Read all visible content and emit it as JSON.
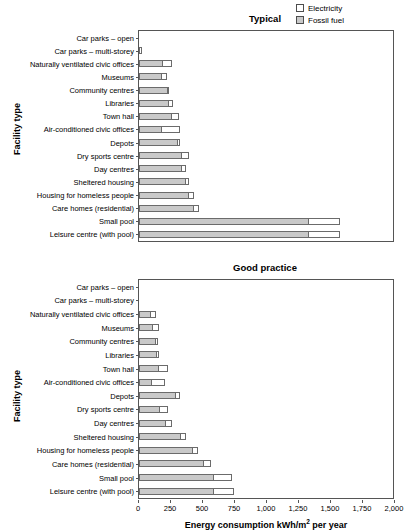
{
  "legend": {
    "items": [
      {
        "label": "Electricity",
        "key": "electricity",
        "color": "#ffffff"
      },
      {
        "label": "Fossil fuel",
        "key": "fossil",
        "color": "#c9c9c9"
      }
    ]
  },
  "axis": {
    "x_title_main": "Energy consumption kWh/m",
    "x_title_sup": "2",
    "x_title_tail": " per year",
    "x_title_full": "Energy consumption kWh/m2 per year",
    "y_title": "Facility type",
    "x_ticks": [
      "0",
      "250",
      "500",
      "750",
      "1,000",
      "1,250",
      "1,500",
      "1,750",
      "2,000"
    ],
    "x_tick_values": [
      0,
      250,
      500,
      750,
      1000,
      1250,
      1500,
      1750,
      2000
    ],
    "xlim": [
      0,
      2000
    ]
  },
  "chart_data": {
    "type": "bar",
    "orientation": "horizontal",
    "stacked": true,
    "xlabel": "Energy consumption kWh/m2 per year",
    "ylabel": "Facility type",
    "xlim": [
      0,
      2000
    ],
    "grid": false,
    "legend_position": "top-right",
    "legend": [
      "Electricity",
      "Fossil fuel"
    ],
    "categories": [
      "Car parks – open",
      "Car parks – multi-storey",
      "Naturally ventilated civic offices",
      "Museums",
      "Community centres",
      "Libraries",
      "Town hall",
      "Air-conditioned civic offices",
      "Depots",
      "Dry sports centre",
      "Day centres",
      "Sheltered housing",
      "Housing for homeless people",
      "Care homes (residential)",
      "Small pool",
      "Leisure centre (with pool)"
    ],
    "panels": [
      {
        "name": "Typical",
        "title": "Typical",
        "series": [
          {
            "name": "Fossil fuel",
            "color": "#c9c9c9",
            "values": [
              0,
              0,
              180,
              170,
              215,
              230,
              250,
              175,
              300,
              330,
              330,
              360,
              380,
              420,
              1320,
              1320
            ]
          },
          {
            "name": "Electricity",
            "color": "#ffffff",
            "values": [
              0,
              20,
              80,
              50,
              15,
              35,
              60,
              145,
              20,
              60,
              35,
              30,
              50,
              45,
              250,
              250
            ]
          }
        ],
        "totals": [
          0,
          20,
          260,
          220,
          230,
          265,
          310,
          320,
          320,
          390,
          365,
          390,
          430,
          465,
          1570,
          1570
        ]
      },
      {
        "name": "Good practice",
        "title": "Good practice",
        "series": [
          {
            "name": "Fossil fuel",
            "color": "#c9c9c9",
            "values": [
              0,
              0,
              85,
              105,
              125,
              135,
              145,
              95,
              280,
              155,
              205,
              320,
              415,
              500,
              575,
              580
            ]
          },
          {
            "name": "Electricity",
            "color": "#ffffff",
            "values": [
              0,
              0,
              45,
              50,
              20,
              25,
              85,
              110,
              40,
              70,
              50,
              45,
              45,
              60,
              150,
              160
            ]
          }
        ],
        "totals": [
          0,
          0,
          130,
          155,
          145,
          160,
          230,
          205,
          320,
          225,
          255,
          365,
          460,
          560,
          725,
          740
        ]
      }
    ]
  }
}
